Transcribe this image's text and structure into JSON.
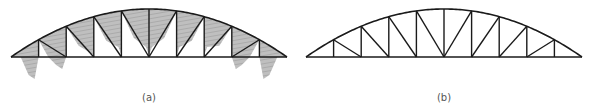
{
  "figure": {
    "panels": [
      {
        "id": "a",
        "label": "(a)",
        "description": "Arched truss with bending moment diagrams (shaded, hatched) drawn on members",
        "offset_x": 0,
        "shaded_moments": true
      },
      {
        "id": "b",
        "label": "(b)",
        "description": "Arched truss geometry (line drawing)",
        "offset_x": 295,
        "shaded_moments": false
      }
    ],
    "geometry": {
      "left_x": 11,
      "right_x": 287,
      "chord_y": 57,
      "apex_y": 9,
      "panels": 10
    },
    "colors": {
      "member": "#1a1a1a",
      "fill": "#b8b8b8",
      "hatch": "#8a8a8a",
      "caption": "#555555"
    }
  }
}
